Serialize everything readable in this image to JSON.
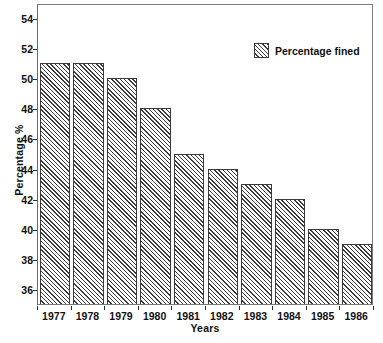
{
  "chart_data": {
    "type": "bar",
    "title": "",
    "xlabel": "Years",
    "ylabel": "Percentage %",
    "categories": [
      "1977",
      "1978",
      "1979",
      "1980",
      "1981",
      "1982",
      "1983",
      "1984",
      "1985",
      "1986"
    ],
    "values": [
      51,
      51,
      50,
      48,
      45,
      44,
      43,
      42,
      40,
      39
    ],
    "series": [
      {
        "name": "Percentage fined",
        "values": [
          51,
          51,
          50,
          48,
          45,
          44,
          43,
          42,
          40,
          39
        ]
      }
    ],
    "ylim": [
      35,
      55
    ],
    "y_ticks": [
      36,
      38,
      40,
      42,
      44,
      46,
      48,
      50,
      52,
      54
    ],
    "y_tick_labels": [
      "36",
      "38",
      "40",
      "42",
      "44",
      "46",
      "48",
      "50",
      "52",
      "54"
    ],
    "grid": false,
    "legend": {
      "position": "top-right",
      "entries": [
        "Percentage fined"
      ]
    },
    "bar_style": {
      "fill": "diagonal-hatch",
      "hatch_color": "#3c3c3c",
      "background": "#ffffff",
      "edge_color": "#3a3a3a"
    },
    "frame_color": "#7a7a7a",
    "text_color": "#111111"
  },
  "legend": {
    "label": "Percentage fined"
  },
  "axes": {
    "y_title": "Percentage %",
    "x_title": "Years"
  }
}
